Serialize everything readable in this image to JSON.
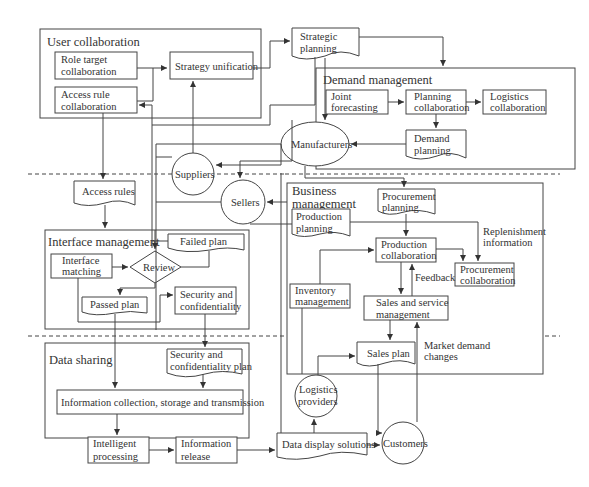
{
  "groups": {
    "user_collaboration": "User collaboration",
    "demand_management": "Demand management",
    "interface_management": "Interface management",
    "business_management": [
      "Business",
      "management"
    ],
    "data_sharing": "Data sharing"
  },
  "nodes": {
    "role_target_collaboration": [
      "Role target",
      "collaboration"
    ],
    "access_rule_collaboration": [
      "Access rule",
      "collaboration"
    ],
    "strategy_unification": "Strategy unification",
    "strategic_planning": [
      "Strategic",
      "planning"
    ],
    "joint_forecasting": [
      "Joint",
      "forecasting"
    ],
    "planning_collaboration": [
      "Planning",
      "collaboration"
    ],
    "logistics_collaboration": [
      "Logistics",
      "collaboration"
    ],
    "demand_planning": [
      "Demand",
      "planning"
    ],
    "manufacturers": "Manufacturers",
    "suppliers": "Suppliers",
    "sellers": "Sellers",
    "access_rules": "Access rules",
    "interface_matching": [
      "Interface",
      "matching"
    ],
    "review": "Review",
    "failed_plan": "Failed plan",
    "passed_plan": "Passed plan",
    "security_and_confidentiality": [
      "Security and",
      "confidentiality"
    ],
    "procurement_planning": [
      "Procurement",
      "planning"
    ],
    "production_planning": [
      "Production",
      "planning"
    ],
    "production_collaboration": [
      "Production",
      "collaboration"
    ],
    "procurement_collaboration": [
      "Procurement",
      "collaboration"
    ],
    "inventory_management": [
      "Inventory",
      "management"
    ],
    "sales_and_service_management": [
      "Sales and service",
      "management"
    ],
    "sales_plan": "Sales plan",
    "security_and_confidentiality_plan": [
      "Security and",
      "confidentiality plan"
    ],
    "information_collection": "Information collection, storage and transmission",
    "intelligent_processing": [
      "Intelligent",
      "processing"
    ],
    "information_release": [
      "Information",
      "release"
    ],
    "data_display_solutions": "Data display solutions",
    "logistics_providers": [
      "Logistics",
      "providers"
    ],
    "customers": "Customers"
  },
  "edge_labels": {
    "replenishment_information": [
      "Replenishment",
      "information"
    ],
    "feedback": "Feedback",
    "market_demand_changes": [
      "Market demand",
      "changes"
    ]
  }
}
